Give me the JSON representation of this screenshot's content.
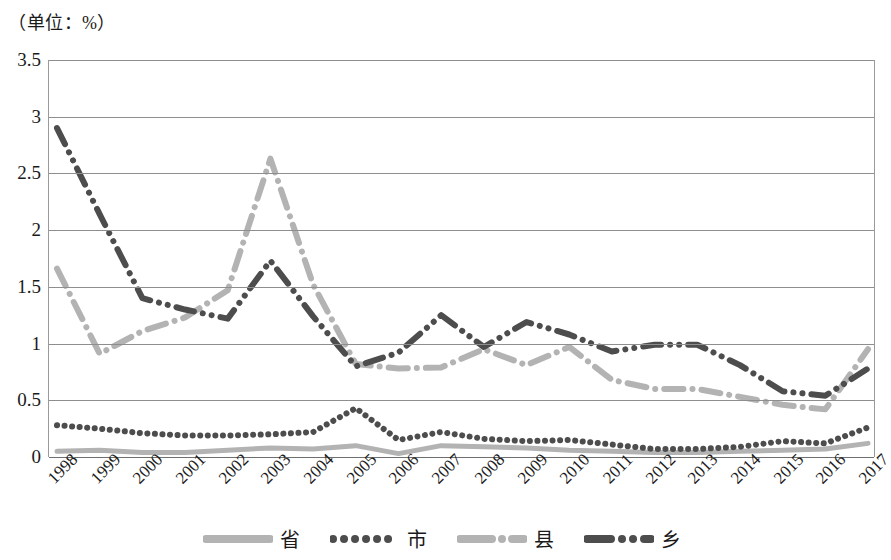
{
  "chart_data": {
    "type": "line",
    "title": "（单位：%）",
    "xlabel": "",
    "ylabel": "",
    "unit_note": "（单位：%）",
    "categories": [
      "1998",
      "1999",
      "2000",
      "2001",
      "2002",
      "2003",
      "2004",
      "2005",
      "2006",
      "2007",
      "2008",
      "2009",
      "2010",
      "2011",
      "2012",
      "2013",
      "2014",
      "2015",
      "2016",
      "2017"
    ],
    "ylim": [
      0,
      3.5
    ],
    "yticks": [
      "0",
      "0.5",
      "1",
      "1.5",
      "2",
      "2.5",
      "3",
      "3.5"
    ],
    "ytick_values": [
      0,
      0.5,
      1,
      1.5,
      2,
      2.5,
      3,
      3.5
    ],
    "grid": true,
    "legend_position": "bottom",
    "series": [
      {
        "name": "省",
        "color": "#b3b3b3",
        "style": "solid",
        "values": [
          0.05,
          0.06,
          0.04,
          0.04,
          0.06,
          0.08,
          0.07,
          0.1,
          0.03,
          0.1,
          0.09,
          0.08,
          0.06,
          0.05,
          0.04,
          0.04,
          0.05,
          0.06,
          0.07,
          0.12
        ]
      },
      {
        "name": "市",
        "color": "#4d4d4d",
        "style": "dotted",
        "values": [
          0.28,
          0.25,
          0.21,
          0.19,
          0.19,
          0.2,
          0.22,
          0.43,
          0.15,
          0.22,
          0.16,
          0.14,
          0.15,
          0.11,
          0.07,
          0.07,
          0.09,
          0.14,
          0.12,
          0.26
        ]
      },
      {
        "name": "县",
        "color": "#b3b3b3",
        "style": "dashdot",
        "values": [
          1.66,
          0.91,
          1.11,
          1.23,
          1.47,
          2.63,
          1.52,
          0.82,
          0.78,
          0.79,
          0.95,
          0.81,
          0.97,
          0.68,
          0.6,
          0.6,
          0.53,
          0.46,
          0.42,
          0.95
        ]
      },
      {
        "name": "乡",
        "color": "#4d4d4d",
        "style": "dashdotdot",
        "values": [
          2.9,
          2.14,
          1.4,
          1.3,
          1.22,
          1.73,
          1.24,
          0.8,
          0.92,
          1.25,
          0.97,
          1.19,
          1.08,
          0.93,
          0.99,
          0.99,
          0.81,
          0.58,
          0.54,
          0.78
        ]
      }
    ]
  },
  "axis": {
    "unit_label": "（单位：%）"
  },
  "legend": {
    "items": [
      {
        "label": "省",
        "marker": "solid-line-light"
      },
      {
        "label": "市",
        "marker": "dotted-line-dark"
      },
      {
        "label": "县",
        "marker": "dashdot-line-light"
      },
      {
        "label": "乡",
        "marker": "dashdotdot-line-dark"
      }
    ]
  }
}
